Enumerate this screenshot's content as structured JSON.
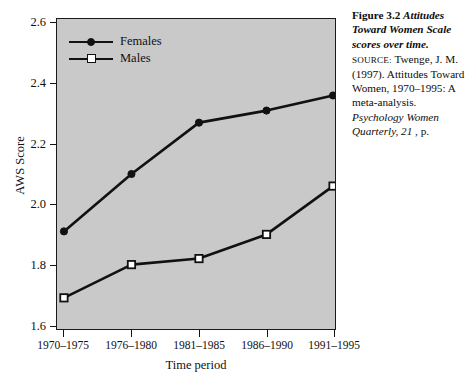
{
  "chart_data": {
    "type": "line",
    "title": "Attitudes Toward Women Scale scores over time.",
    "xlabel": "Time period",
    "ylabel": "AWS Score",
    "categories": [
      "1970–1975",
      "1976–1980",
      "1981–1985",
      "1986–1990",
      "1991–1995"
    ],
    "series": [
      {
        "name": "Females",
        "marker": "filled-circle",
        "values": [
          1.91,
          2.1,
          2.27,
          2.31,
          2.36
        ]
      },
      {
        "name": "Males",
        "marker": "open-square",
        "values": [
          1.69,
          1.8,
          1.82,
          1.9,
          2.06
        ]
      }
    ],
    "ylim": [
      1.6,
      2.6
    ],
    "yticks": [
      1.6,
      1.8,
      2.0,
      2.2,
      2.4,
      2.6
    ],
    "ytick_labels": [
      "1.6",
      "1.8",
      "2.0",
      "2.2",
      "2.4",
      "2.6"
    ],
    "grid": false,
    "legend_position": "top-left",
    "plot_background": "#c9c9c9",
    "line_color": "#111111"
  },
  "axes": {
    "y_title": "AWS Score",
    "x_title": "Time period"
  },
  "legend": {
    "items": [
      {
        "label": "Females",
        "marker": "filled-circle"
      },
      {
        "label": "Males",
        "marker": "open-square"
      }
    ]
  },
  "caption": {
    "figure_number": "Figure 3.2",
    "figure_title": "Attitudes Toward Women Scale scores over time.",
    "source_label": "SOURCE:",
    "source_text_1": "Twenge, J. M. (1997). Attitudes Toward",
    "source_text_2": "Women, 1970–1995: A meta-analysis. ",
    "source_journal": "Psychology",
    "source_journal_2": "Women Quarterly, 21",
    "source_tail": ", p. "
  }
}
